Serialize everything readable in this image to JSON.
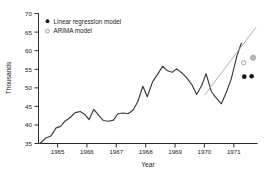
{
  "chart_data": {
    "type": "line",
    "title": "",
    "xlabel": "Year",
    "ylabel": "Thousands",
    "xlim": [
      1964.3,
      1971.75
    ],
    "ylim": [
      35,
      70
    ],
    "ytick_labels": [
      "35",
      "40",
      "45",
      "50",
      "55",
      "60",
      "65",
      "70"
    ],
    "ytick_values": [
      35,
      40,
      45,
      50,
      55,
      60,
      65,
      70
    ],
    "xtick_labels": [
      "1965",
      "1966",
      "1967",
      "1968",
      "1969",
      "1970",
      "1971"
    ],
    "xtick_values": [
      1965,
      1966,
      1967,
      1968,
      1969,
      1970,
      1971
    ],
    "grid": false,
    "legend_position": "top-left",
    "legend": [
      {
        "label": "Linear regression model",
        "marker": "filled-circle",
        "color": "#151515"
      },
      {
        "label": "ARIMA model",
        "marker": "open-circle",
        "color": "#8c8c8c"
      }
    ],
    "series": [
      {
        "name": "observed",
        "style": "line",
        "color": "#3a3a3a",
        "x": [
          1964.35,
          1964.55,
          1964.72,
          1964.9,
          1965.05,
          1965.2,
          1965.38,
          1965.55,
          1965.72,
          1965.88,
          1966.02,
          1966.18,
          1966.35,
          1966.5,
          1966.68,
          1966.85,
          1967.0,
          1967.18,
          1967.35,
          1967.52,
          1967.68,
          1967.85,
          1968.0,
          1968.18,
          1968.35,
          1968.52,
          1968.68,
          1968.85,
          1969.0,
          1969.18,
          1969.35,
          1969.52,
          1969.68,
          1969.85,
          1970.0,
          1970.18,
          1970.35,
          1970.52,
          1970.68,
          1970.85,
          1971.05,
          1971.2
        ],
        "y": [
          35.0,
          36.5,
          37.0,
          39.2,
          39.6,
          41.0,
          42.0,
          43.3,
          43.6,
          42.8,
          41.4,
          44.2,
          42.6,
          41.2,
          41.0,
          41.3,
          43.0,
          43.2,
          43.0,
          44.0,
          46.3,
          50.4,
          47.6,
          51.6,
          53.6,
          55.8,
          54.6,
          54.2,
          55.1,
          54.0,
          52.6,
          50.8,
          48.2,
          50.6,
          53.8,
          49.0,
          47.2,
          45.7,
          48.6,
          52.2,
          58.6,
          62.0
        ]
      },
      {
        "name": "extrapolation",
        "style": "thin-line",
        "color": "#9a9a9a",
        "x": [
          1969.95,
          1971.7
        ],
        "y": [
          48.0,
          66.3
        ]
      }
    ],
    "forecast_points": [
      {
        "model": "Linear regression model",
        "x": 1971.3,
        "y": 53.0,
        "marker": "filled-circle"
      },
      {
        "model": "Linear regression model",
        "x": 1971.55,
        "y": 53.1,
        "marker": "filled-circle"
      },
      {
        "model": "ARIMA model",
        "x": 1971.28,
        "y": 56.7,
        "marker": "open-circle"
      },
      {
        "model": "ARIMA model",
        "x": 1971.6,
        "y": 58.1,
        "marker": "open-circle-large"
      }
    ]
  }
}
